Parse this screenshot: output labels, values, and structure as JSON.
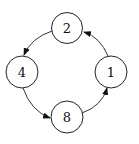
{
  "diagram": {
    "type": "cycle-graph",
    "nodes": [
      {
        "id": "n2",
        "label": "2",
        "cx": 67,
        "cy": 28,
        "r": 15.5
      },
      {
        "id": "n4",
        "label": "4",
        "cx": 22,
        "cy": 72,
        "r": 16
      },
      {
        "id": "n1",
        "label": "1",
        "cx": 111,
        "cy": 72,
        "r": 16
      },
      {
        "id": "n8",
        "label": "8",
        "cx": 67,
        "cy": 117,
        "r": 16
      }
    ],
    "edges": [
      {
        "from": "1",
        "to": "2"
      },
      {
        "from": "2",
        "to": "4"
      },
      {
        "from": "4",
        "to": "8"
      },
      {
        "from": "8",
        "to": "1"
      }
    ]
  }
}
